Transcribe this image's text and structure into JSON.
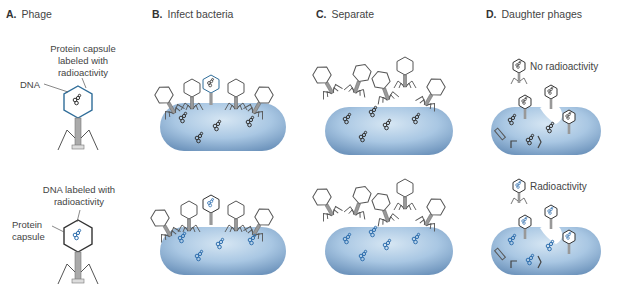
{
  "panels": [
    {
      "letter": "A.",
      "title": "Phage"
    },
    {
      "letter": "B.",
      "title": "Infect bacteria"
    },
    {
      "letter": "C.",
      "title": "Separate"
    },
    {
      "letter": "D.",
      "title": "Daughter phages"
    }
  ],
  "top_row": {
    "capsule_label_1": "Protein capsule",
    "capsule_label_2": "labeled with",
    "capsule_label_3": "radioactivity",
    "dna_label": "DNA",
    "result_label": "No radioactivity"
  },
  "bottom_row": {
    "dna_label_1": "DNA labeled with",
    "dna_label_2": "radioactivity",
    "capsule_label_1": "Protein",
    "capsule_label_2": "capsule",
    "result_label": "Radioactivity"
  },
  "colors": {
    "cell_fill": "#a9c7e3",
    "cell_dark": "#6f95bd",
    "label_outline": "#2f6d99",
    "radio_dna": "#2f6fae",
    "plain_dna": "#333333",
    "phage_line": "#555555"
  }
}
